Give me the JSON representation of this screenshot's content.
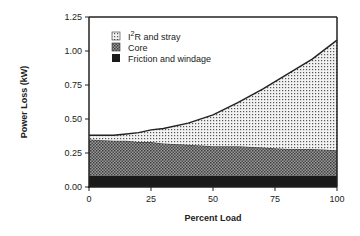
{
  "chart_data": {
    "type": "area",
    "stacked": true,
    "title": "",
    "xlabel": "Percent Load",
    "ylabel": "Power Loss (kW)",
    "xlim": [
      0,
      100
    ],
    "ylim": [
      0,
      1.25
    ],
    "xticks": [
      0,
      25,
      50,
      75,
      100
    ],
    "xtick_labels": [
      "0",
      "25",
      "50",
      "75",
      "100"
    ],
    "yticks": [
      0,
      0.25,
      0.5,
      0.75,
      1.0,
      1.25
    ],
    "ytick_labels": [
      "0.00",
      "0.25",
      "0.50",
      "0.75",
      "1.00",
      "1.25"
    ],
    "grid": false,
    "legend_position": "upper left inside",
    "x": [
      0,
      10,
      15,
      20,
      25,
      30,
      40,
      50,
      60,
      70,
      80,
      90,
      100
    ],
    "series": [
      {
        "name": "Friction and windage",
        "pattern": "solid-dark",
        "values": [
          0.08,
          0.08,
          0.08,
          0.08,
          0.08,
          0.08,
          0.08,
          0.08,
          0.08,
          0.08,
          0.08,
          0.08,
          0.08
        ]
      },
      {
        "name": "Core",
        "pattern": "crosshatch",
        "values": [
          0.27,
          0.26,
          0.26,
          0.25,
          0.25,
          0.24,
          0.23,
          0.22,
          0.22,
          0.21,
          0.2,
          0.2,
          0.19
        ]
      },
      {
        "name": "I2R and stray",
        "pattern": "dots",
        "values": [
          0.03,
          0.04,
          0.05,
          0.07,
          0.09,
          0.11,
          0.16,
          0.23,
          0.32,
          0.43,
          0.55,
          0.66,
          0.81
        ]
      }
    ],
    "totals": [
      0.38,
      0.38,
      0.39,
      0.4,
      0.42,
      0.43,
      0.47,
      0.53,
      0.62,
      0.72,
      0.83,
      0.94,
      1.08
    ]
  },
  "legend": [
    {
      "label_prefix": "I",
      "label_sup": "2",
      "label_suffix": "R and stray"
    },
    {
      "label": "Core"
    },
    {
      "label": "Friction and windage"
    }
  ],
  "colors": {
    "friction": "#1a1a1a",
    "core": "#6e6e6e",
    "i2r": "#d9d9d9",
    "axis": "#222222"
  }
}
